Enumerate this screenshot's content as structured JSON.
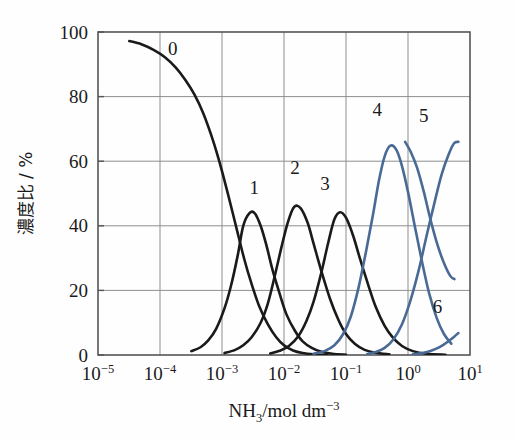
{
  "chart_data": {
    "type": "line",
    "title": "",
    "subtitle": "",
    "xlabel_parts": {
      "species": "NH",
      "species_sub": "3",
      "unit": "/mol dm",
      "unit_exp": "-3"
    },
    "xlabel": "NH3/mol dm-3",
    "ylabel": "濃度比 / %",
    "ylabel_parts": {
      "cjk": "濃度比",
      "slash_unit": "/ %"
    },
    "xscale": "log",
    "xlim": [
      1e-05,
      10
    ],
    "ylim": [
      0,
      100
    ],
    "grid": true,
    "legend_position": "inline-curve-labels",
    "x_ticks": [
      {
        "value": 1e-05,
        "mantissa": "10",
        "exponent": "-5"
      },
      {
        "value": 0.0001,
        "mantissa": "10",
        "exponent": "-4"
      },
      {
        "value": 0.001,
        "mantissa": "10",
        "exponent": "-3"
      },
      {
        "value": 0.01,
        "mantissa": "10",
        "exponent": "-2"
      },
      {
        "value": 0.1,
        "mantissa": "10",
        "exponent": "-1"
      },
      {
        "value": 1,
        "mantissa": "10",
        "exponent": "0"
      },
      {
        "value": 10,
        "mantissa": "10",
        "exponent": "1"
      }
    ],
    "y_ticks": [
      {
        "value": 0,
        "label": "0"
      },
      {
        "value": 20,
        "label": "20"
      },
      {
        "value": 40,
        "label": "40"
      },
      {
        "value": 60,
        "label": "60"
      },
      {
        "value": 80,
        "label": "80"
      },
      {
        "value": 100,
        "label": "100"
      }
    ],
    "colors": {
      "black_series": "#1a1a1a",
      "blue_series": "#4a6a96",
      "grid": "#8e8e8e",
      "axis": "#555555",
      "background": "#fefefe"
    },
    "series": [
      {
        "name": "0",
        "label": "0",
        "color": "#1a1a1a",
        "label_x": 0.00016,
        "label_y": 93,
        "peak": {
          "x": 1e-05,
          "y": 100
        },
        "points": [
          [
            3.2e-05,
            97.2
          ],
          [
            5e-05,
            96.2
          ],
          [
            8e-05,
            94.4
          ],
          [
            0.00012,
            92.2
          ],
          [
            0.00018,
            89.0
          ],
          [
            0.00026,
            85.0
          ],
          [
            0.00036,
            80.6
          ],
          [
            0.0005,
            74.8
          ],
          [
            0.0007,
            67.0
          ],
          [
            0.00095,
            58.5
          ],
          [
            0.0013,
            48.5
          ],
          [
            0.0017,
            39.5
          ],
          [
            0.0023,
            29.5
          ],
          [
            0.003,
            22.0
          ],
          [
            0.004,
            15.0
          ],
          [
            0.0055,
            9.5
          ],
          [
            0.0075,
            5.5
          ],
          [
            0.01,
            3.0
          ],
          [
            0.014,
            1.4
          ],
          [
            0.02,
            0.6
          ],
          [
            0.03,
            0.2
          ],
          [
            0.05,
            0.0
          ]
        ]
      },
      {
        "name": "1",
        "label": "1",
        "color": "#1a1a1a",
        "label_x": 0.0033,
        "label_y": 50,
        "peak": {
          "x": 0.0022,
          "y": 44
        },
        "points": [
          [
            0.00032,
            1.2
          ],
          [
            0.00045,
            2.4
          ],
          [
            0.0006,
            4.5
          ],
          [
            0.0008,
            8.0
          ],
          [
            0.0011,
            14.5
          ],
          [
            0.0014,
            21.5
          ],
          [
            0.0018,
            31.0
          ],
          [
            0.0022,
            40.0
          ],
          [
            0.0028,
            44.0
          ],
          [
            0.0034,
            43.8
          ],
          [
            0.0042,
            40.0
          ],
          [
            0.0052,
            34.0
          ],
          [
            0.0065,
            26.5
          ],
          [
            0.0085,
            19.0
          ],
          [
            0.011,
            12.5
          ],
          [
            0.015,
            7.5
          ],
          [
            0.02,
            4.2
          ],
          [
            0.028,
            2.2
          ],
          [
            0.04,
            1.0
          ],
          [
            0.06,
            0.4
          ],
          [
            0.1,
            0.1
          ]
        ]
      },
      {
        "name": "2",
        "label": "2",
        "color": "#1a1a1a",
        "label_x": 0.015,
        "label_y": 56,
        "peak": {
          "x": 0.013,
          "y": 46
        },
        "points": [
          [
            0.0011,
            0.6
          ],
          [
            0.0016,
            1.5
          ],
          [
            0.0022,
            3.0
          ],
          [
            0.003,
            5.5
          ],
          [
            0.0042,
            10.0
          ],
          [
            0.0055,
            16.0
          ],
          [
            0.007,
            24.0
          ],
          [
            0.009,
            33.0
          ],
          [
            0.0115,
            41.0
          ],
          [
            0.0145,
            45.8
          ],
          [
            0.0185,
            45.5
          ],
          [
            0.024,
            41.0
          ],
          [
            0.03,
            34.5
          ],
          [
            0.04,
            26.0
          ],
          [
            0.055,
            17.5
          ],
          [
            0.075,
            11.0
          ],
          [
            0.1,
            6.5
          ],
          [
            0.14,
            3.4
          ],
          [
            0.2,
            1.6
          ],
          [
            0.3,
            0.7
          ],
          [
            0.5,
            0.2
          ]
        ]
      },
      {
        "name": "3",
        "label": "3",
        "color": "#1a1a1a",
        "label_x": 0.046,
        "label_y": 51,
        "peak": {
          "x": 0.055,
          "y": 44
        },
        "points": [
          [
            0.006,
            0.5
          ],
          [
            0.0085,
            1.3
          ],
          [
            0.012,
            2.8
          ],
          [
            0.017,
            5.8
          ],
          [
            0.023,
            10.5
          ],
          [
            0.03,
            16.5
          ],
          [
            0.04,
            25.5
          ],
          [
            0.052,
            35.0
          ],
          [
            0.065,
            42.0
          ],
          [
            0.08,
            44.2
          ],
          [
            0.1,
            42.5
          ],
          [
            0.13,
            37.0
          ],
          [
            0.17,
            29.5
          ],
          [
            0.23,
            21.5
          ],
          [
            0.3,
            15.0
          ],
          [
            0.42,
            9.0
          ],
          [
            0.58,
            5.2
          ],
          [
            0.8,
            2.8
          ],
          [
            1.2,
            1.2
          ],
          [
            2.0,
            0.4
          ],
          [
            4.0,
            0.1
          ]
        ]
      },
      {
        "name": "4",
        "label": "4",
        "color": "#4a6a96",
        "label_x": 0.32,
        "label_y": 74,
        "peak": {
          "x": 0.45,
          "y": 65
        },
        "points": [
          [
            0.03,
            0.4
          ],
          [
            0.045,
            1.2
          ],
          [
            0.065,
            3.0
          ],
          [
            0.09,
            6.5
          ],
          [
            0.12,
            12.0
          ],
          [
            0.16,
            21.0
          ],
          [
            0.21,
            32.0
          ],
          [
            0.27,
            43.0
          ],
          [
            0.34,
            54.0
          ],
          [
            0.42,
            61.5
          ],
          [
            0.52,
            64.8
          ],
          [
            0.65,
            63.5
          ],
          [
            0.8,
            58.5
          ],
          [
            1.0,
            50.5
          ],
          [
            1.3,
            39.5
          ],
          [
            1.7,
            28.5
          ],
          [
            2.2,
            19.0
          ],
          [
            2.9,
            11.5
          ],
          [
            3.8,
            6.5
          ],
          [
            5.0,
            3.5
          ]
        ]
      },
      {
        "name": "5",
        "label": "5",
        "color": "#4a6a96",
        "label_x": 1.8,
        "label_y": 72,
        "peak": {
          "x": 10,
          "y": 66
        },
        "points": [
          [
            0.22,
            0.3
          ],
          [
            0.3,
            0.9
          ],
          [
            0.42,
            2.2
          ],
          [
            0.58,
            4.8
          ],
          [
            0.8,
            9.5
          ],
          [
            1.1,
            17.0
          ],
          [
            1.5,
            26.5
          ],
          [
            2.0,
            37.0
          ],
          [
            2.7,
            47.5
          ],
          [
            3.5,
            56.0
          ],
          [
            4.5,
            62.0
          ],
          [
            5.5,
            65.5
          ],
          [
            6.5,
            66.0
          ]
        ]
      },
      {
        "name": "6",
        "label": "6",
        "color": "#4a6a96",
        "label_x": 3.0,
        "label_y": 13,
        "peak": {
          "x": 10,
          "y": 7
        },
        "points": [
          [
            1.2,
            0.2
          ],
          [
            1.6,
            0.5
          ],
          [
            2.1,
            1.0
          ],
          [
            2.8,
            1.9
          ],
          [
            3.6,
            3.0
          ],
          [
            4.5,
            4.3
          ],
          [
            5.5,
            5.6
          ],
          [
            6.5,
            6.8
          ]
        ]
      },
      {
        "name": "5-descending",
        "label": "",
        "color": "#4a6a96",
        "label_x": 0,
        "label_y": 0,
        "peak": {
          "x": 0,
          "y": 0
        },
        "points": [
          [
            0.9,
            66.0
          ],
          [
            1.1,
            63.0
          ],
          [
            1.4,
            58.0
          ],
          [
            1.8,
            50.5
          ],
          [
            2.3,
            42.0
          ],
          [
            3.0,
            34.0
          ],
          [
            3.8,
            28.5
          ],
          [
            4.8,
            24.5
          ],
          [
            5.6,
            23.5
          ]
        ]
      }
    ]
  },
  "figure": {
    "plot_left_px": 98,
    "plot_right_px": 470,
    "plot_top_px": 32,
    "plot_bottom_px": 355
  }
}
